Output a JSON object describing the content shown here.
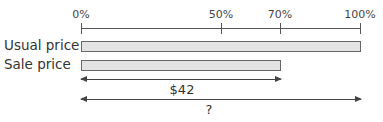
{
  "axis": {
    "ticks": [
      {
        "label": "0%",
        "value": 0
      },
      {
        "label": "50%",
        "value": 50
      },
      {
        "label": "70%",
        "value": 70
      },
      {
        "label": "100%",
        "value": 100
      }
    ]
  },
  "bars": [
    {
      "label": "Usual price",
      "percent": 100
    },
    {
      "label": "Sale price",
      "percent": 70
    }
  ],
  "arrows": [
    {
      "label": "$42",
      "span_percent": 70
    },
    {
      "label": "?",
      "span_percent": 100
    }
  ],
  "colors": {
    "bar_fill": "#e3e3e3",
    "bar_border": "#666666",
    "line": "#555555"
  }
}
